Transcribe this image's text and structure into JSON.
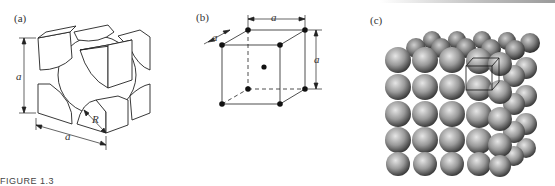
{
  "figure": {
    "caption": "FIGURE 1.3",
    "panels": [
      {
        "id": "a",
        "label": "(a)",
        "description": "Body-centered cubic unit cell, hard-sphere model showing corner sphere sections and central sphere",
        "dimensions": {
          "edge": "a",
          "radius": "R"
        }
      },
      {
        "id": "b",
        "label": "(b)",
        "description": "Reduced-sphere BCC unit cell with atoms at corners and body center",
        "dimensions": {
          "top_edge": "a",
          "depth_edge": "a",
          "height_edge": "a"
        }
      },
      {
        "id": "c",
        "label": "(c)",
        "description": "Aggregate of many atoms with a unit cell outlined"
      }
    ]
  },
  "colors": {
    "line": "#222222",
    "sphere_light": "#d8d8d8",
    "sphere_dark": "#4a4a4a"
  }
}
